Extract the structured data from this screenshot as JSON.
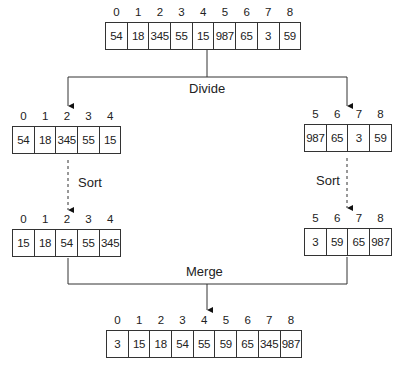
{
  "labels": {
    "divide": "Divide",
    "sort_left": "Sort",
    "sort_right": "Sort",
    "merge": "Merge"
  },
  "arrays": {
    "original": {
      "indices": [
        "0",
        "1",
        "2",
        "3",
        "4",
        "5",
        "6",
        "7",
        "8"
      ],
      "values": [
        "54",
        "18",
        "345",
        "55",
        "15",
        "987",
        "65",
        "3",
        "59"
      ]
    },
    "left_half": {
      "indices": [
        "0",
        "1",
        "2",
        "3",
        "4"
      ],
      "values": [
        "54",
        "18",
        "345",
        "55",
        "15"
      ]
    },
    "right_half": {
      "indices": [
        "5",
        "6",
        "7",
        "8"
      ],
      "values": [
        "987",
        "65",
        "3",
        "59"
      ]
    },
    "left_sorted": {
      "indices": [
        "0",
        "1",
        "2",
        "3",
        "4"
      ],
      "values": [
        "15",
        "18",
        "54",
        "55",
        "345"
      ]
    },
    "right_sorted": {
      "indices": [
        "5",
        "6",
        "7",
        "8"
      ],
      "values": [
        "3",
        "59",
        "65",
        "987"
      ]
    },
    "merged": {
      "indices": [
        "0",
        "1",
        "2",
        "3",
        "4",
        "5",
        "6",
        "7",
        "8"
      ],
      "values": [
        "3",
        "15",
        "18",
        "54",
        "55",
        "59",
        "65",
        "345",
        "987"
      ]
    }
  }
}
